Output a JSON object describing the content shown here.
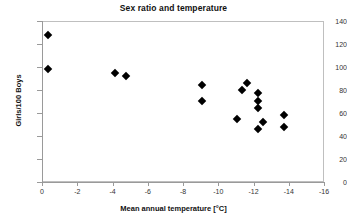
{
  "chart_data": {
    "type": "scatter",
    "title": "Sex ratio and temperature",
    "xlabel": "Mean annual temperature [°C]",
    "ylabel": "Girls/100 Boys",
    "xlim": [
      0,
      -16
    ],
    "ylim": [
      0,
      140
    ],
    "x_ticks": [
      "0",
      "-2",
      "-4",
      "-6",
      "-8",
      "-10",
      "-12",
      "-14",
      "-16"
    ],
    "x_tick_values": [
      0,
      -2,
      -4,
      -6,
      -8,
      -10,
      -12,
      -14,
      -16
    ],
    "y_ticks": [
      "0",
      "20",
      "40",
      "60",
      "80",
      "100",
      "120",
      "140"
    ],
    "y_tick_values": [
      0,
      20,
      40,
      60,
      80,
      100,
      120,
      140
    ],
    "grid": false,
    "legend": false,
    "marker": "diamond",
    "marker_color": "#000000",
    "series": [
      {
        "name": "Sex ratio vs temperature",
        "points": [
          {
            "x": -0.3,
            "y": 129
          },
          {
            "x": -0.3,
            "y": 99
          },
          {
            "x": -4.1,
            "y": 96
          },
          {
            "x": -4.7,
            "y": 93
          },
          {
            "x": -9.0,
            "y": 85
          },
          {
            "x": -9.0,
            "y": 71
          },
          {
            "x": -11.0,
            "y": 56
          },
          {
            "x": -11.3,
            "y": 81
          },
          {
            "x": -11.6,
            "y": 87
          },
          {
            "x": -12.2,
            "y": 78
          },
          {
            "x": -12.2,
            "y": 71
          },
          {
            "x": -12.2,
            "y": 65
          },
          {
            "x": -12.2,
            "y": 47
          },
          {
            "x": -12.5,
            "y": 53
          },
          {
            "x": -13.7,
            "y": 59
          },
          {
            "x": -13.7,
            "y": 49
          }
        ]
      }
    ]
  }
}
